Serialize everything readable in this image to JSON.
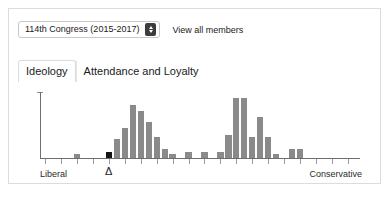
{
  "card": {
    "toolbar": {
      "congress_select": {
        "value": "114th Congress (2015-2017)",
        "stepper_icon": "stepper-up-down-icon"
      },
      "view_all_label": "View all members"
    },
    "tabs": [
      {
        "label": "Ideology",
        "active": true
      },
      {
        "label": "Attendance and Loyalty",
        "active": false
      }
    ]
  },
  "chart_data": {
    "type": "bar",
    "title": "",
    "xlabel": "",
    "ylabel": "",
    "grid": false,
    "legend": null,
    "axis_labels": {
      "left": "Liberal",
      "right": "Conservative"
    },
    "marker": {
      "symbol": "Δ",
      "bin_index": 8,
      "label": "selected-member-position"
    },
    "highlight_bin_index": 8,
    "highlight_color": "#141414",
    "bar_color": "#8a8a8a",
    "bin_count": 40,
    "ylim": [
      0,
      30
    ],
    "values": [
      0,
      0,
      0,
      0,
      2,
      0,
      0,
      0,
      3,
      9,
      14,
      25,
      22,
      17,
      10,
      4,
      2,
      0,
      3,
      0,
      3,
      0,
      3,
      11,
      28,
      28,
      10,
      19,
      10,
      2,
      0,
      4,
      4,
      0,
      0,
      0,
      0,
      0,
      0,
      0
    ]
  }
}
